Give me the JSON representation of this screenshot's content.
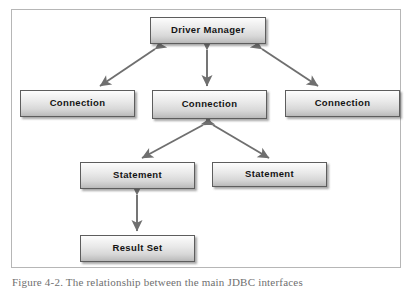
{
  "figure": {
    "caption": "Figure 4-2. The relationship between the main JDBC interfaces",
    "frame_border_color": "#b6b6b6",
    "background_color": "#ffffff"
  },
  "diagram": {
    "type": "hierarchy",
    "node_text_color": "#141414",
    "node_border_color": "#5d5d5d",
    "arrow_color": "#6b6b6b",
    "nodes": [
      {
        "id": "driver-manager",
        "label": "Driver Manager",
        "level": 0
      },
      {
        "id": "connection-1",
        "label": "Connection",
        "level": 1
      },
      {
        "id": "connection-2",
        "label": "Connection",
        "level": 1
      },
      {
        "id": "connection-3",
        "label": "Connection",
        "level": 1
      },
      {
        "id": "statement-1",
        "label": "Statement",
        "level": 2
      },
      {
        "id": "statement-2",
        "label": "Statement",
        "level": 2
      },
      {
        "id": "result-set",
        "label": "Result Set",
        "level": 3
      }
    ],
    "edges": [
      {
        "from": "driver-manager",
        "to": "connection-1",
        "style": "double-arrow",
        "orientation": "diagonal-left"
      },
      {
        "from": "driver-manager",
        "to": "connection-2",
        "style": "double-arrow",
        "orientation": "vertical"
      },
      {
        "from": "driver-manager",
        "to": "connection-3",
        "style": "double-arrow",
        "orientation": "diagonal-right"
      },
      {
        "from": "connection-2",
        "to": "statement-1",
        "style": "double-arrow",
        "orientation": "diagonal-left"
      },
      {
        "from": "connection-2",
        "to": "statement-2",
        "style": "double-arrow",
        "orientation": "diagonal-right"
      },
      {
        "from": "statement-1",
        "to": "result-set",
        "style": "double-arrow",
        "orientation": "vertical"
      }
    ]
  }
}
